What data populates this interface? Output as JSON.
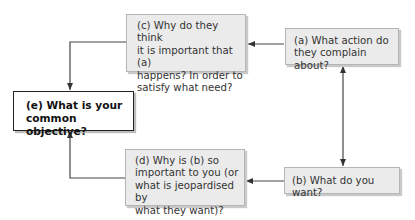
{
  "diagram": {
    "nodes": {
      "a": {
        "label": "(a) What action do\nthey complain about?"
      },
      "b": {
        "label": "(b) What do you want?"
      },
      "c": {
        "label": "(c) Why do they think\nit is important that (a)\nhappens? In order to\nsatisfy what need?"
      },
      "d": {
        "label": "(d) Why is (b) so\nimportant to you (or\nwhat is jeopardised by\nwhat they want)?"
      },
      "e": {
        "label": "(e) What is your\ncommon objective?"
      }
    },
    "edges": [
      {
        "from": "a",
        "to": "c",
        "type": "arrow"
      },
      {
        "from": "a",
        "to": "b",
        "type": "double-arrow"
      },
      {
        "from": "b",
        "to": "d",
        "type": "arrow"
      },
      {
        "from": "c",
        "to": "e",
        "type": "elbow-arrow"
      },
      {
        "from": "d",
        "to": "e",
        "type": "elbow-arrow"
      }
    ],
    "colors": {
      "box_fill": "#ebebeb",
      "box_border": "#b5b5b5",
      "emphasis_border": "#222222",
      "line": "#444444"
    }
  }
}
